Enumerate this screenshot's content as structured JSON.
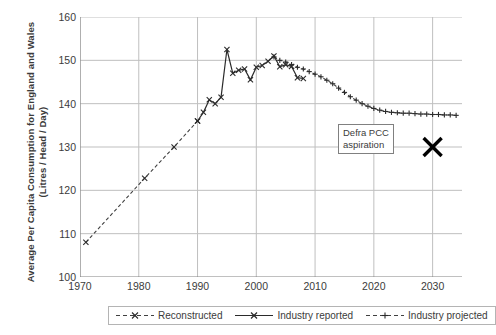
{
  "chart_data": {
    "type": "line",
    "title": "",
    "xlabel": "",
    "ylabel": "Average Per Capita Consumption for England and Wales  (Litres / Head / Day)",
    "xlim": [
      1970,
      2035
    ],
    "ylim": [
      100,
      160
    ],
    "xticks": [
      1970,
      1980,
      1990,
      2000,
      2010,
      2020,
      2030
    ],
    "yticks": [
      100,
      110,
      120,
      130,
      140,
      150,
      160
    ],
    "grid": true,
    "legend_position": "bottom",
    "series": [
      {
        "name": "Reconstructed",
        "style": "dashed",
        "marker": "x",
        "color": "#404040",
        "points": [
          [
            1971,
            108.0
          ],
          [
            1981,
            122.8
          ],
          [
            1986,
            130.0
          ],
          [
            1990,
            136.0
          ]
        ]
      },
      {
        "name": "Industry reported",
        "style": "solid",
        "marker": "x",
        "color": "#2b2b2b",
        "points": [
          [
            1990,
            136.0
          ],
          [
            1991,
            138.0
          ],
          [
            1992,
            140.9
          ],
          [
            1993,
            140.0
          ],
          [
            1994,
            141.5
          ],
          [
            1995,
            152.5
          ],
          [
            1996,
            147.0
          ],
          [
            1997,
            147.7
          ],
          [
            1998,
            148.0
          ],
          [
            1999,
            145.5
          ],
          [
            2000,
            148.4
          ],
          [
            2001,
            148.8
          ],
          [
            2002,
            149.8
          ],
          [
            2003,
            151.0
          ],
          [
            2004,
            148.5
          ],
          [
            2005,
            149.0
          ],
          [
            2006,
            148.6
          ],
          [
            2007,
            146.0
          ],
          [
            2008,
            145.8
          ]
        ]
      },
      {
        "name": "Industry projected",
        "style": "dashed",
        "marker": "+",
        "color": "#404040",
        "points": [
          [
            2003,
            150.8
          ],
          [
            2004,
            150.0
          ],
          [
            2005,
            149.6
          ],
          [
            2006,
            149.0
          ],
          [
            2007,
            148.4
          ],
          [
            2008,
            148.0
          ],
          [
            2009,
            147.4
          ],
          [
            2010,
            146.8
          ],
          [
            2011,
            146.2
          ],
          [
            2012,
            145.4
          ],
          [
            2013,
            144.6
          ],
          [
            2014,
            143.6
          ],
          [
            2015,
            142.6
          ],
          [
            2016,
            141.6
          ],
          [
            2017,
            140.8
          ],
          [
            2018,
            140.0
          ],
          [
            2019,
            139.4
          ],
          [
            2020,
            138.9
          ],
          [
            2021,
            138.5
          ],
          [
            2022,
            138.2
          ],
          [
            2023,
            138.0
          ],
          [
            2024,
            137.9
          ],
          [
            2025,
            137.8
          ],
          [
            2026,
            137.8
          ],
          [
            2027,
            137.7
          ],
          [
            2028,
            137.6
          ],
          [
            2029,
            137.6
          ],
          [
            2030,
            137.5
          ],
          [
            2031,
            137.5
          ],
          [
            2032,
            137.4
          ],
          [
            2033,
            137.4
          ],
          [
            2034,
            137.3
          ]
        ]
      }
    ],
    "annotations": [
      {
        "name": "defra-pcc-aspiration",
        "text_line1": "Defra PCC",
        "text_line2": "aspiration",
        "marker": "X",
        "marker_point": [
          2030,
          130.0
        ],
        "marker_color": "#000000"
      }
    ]
  },
  "legend": {
    "items": [
      {
        "label": "Reconstructed"
      },
      {
        "label": "Industry reported"
      },
      {
        "label": "Industry projected"
      }
    ]
  },
  "colors": {
    "grid": "#bfbfbf",
    "axis": "#808080",
    "text": "#3b3b3b",
    "line": "#2b2b2b"
  }
}
